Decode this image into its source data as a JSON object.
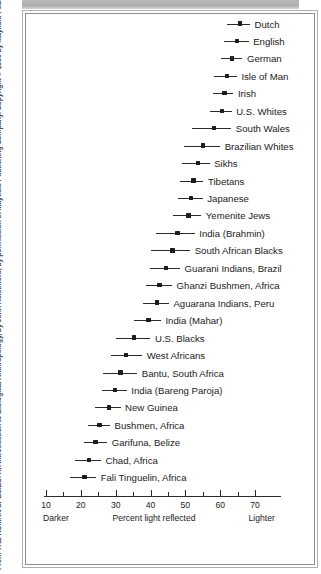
{
  "figure": {
    "credit": "From THE HUMAN SPECIES: An Introduction to Biological Anthropology, by John Relethford, by permission of Mayfield Publishing Company. Copyright © 1990 by Mayfield Publishing Company",
    "frame_color": "#8e8e8e",
    "ink_color": "#1d1d1d"
  },
  "chart_data": {
    "type": "scatter",
    "title": "",
    "xlabel": "Percent light reflected",
    "ylabel": "",
    "xlim": [
      8,
      78
    ],
    "grid": false,
    "legend": "none",
    "axis": {
      "major_ticks": [
        10,
        20,
        30,
        40,
        50,
        60,
        70
      ],
      "major_tick_labels": [
        "10",
        "20",
        "30",
        "40",
        "50",
        "60",
        "70"
      ],
      "minor_ticks": [
        15,
        25,
        35,
        45,
        55,
        65
      ],
      "left_end_label": "Darker",
      "right_end_label": "Lighter",
      "axis_title": "Percent light reflected"
    },
    "series_note": "mean percent light reflected with range bars",
    "categories": [
      "Dutch",
      "English",
      "German",
      "Isle of Man",
      "Irish",
      "U.S. Whites",
      "South Wales",
      "Brazilian Whites",
      "Sikhs",
      "Tibetans",
      "Japanese",
      "Yemenite Jews",
      "India (Brahmin)",
      "South African Blacks",
      "Guarani Indians, Brazil",
      "Ghanzi Bushmen, Africa",
      "Aguarana Indians, Peru",
      "India (Mahar)",
      "U.S. Blacks",
      "West Africans",
      "Bantu, South Africa",
      "India (Bareng Paroja)",
      "New Guinea",
      "Bushmen, Africa",
      "Garifuna, Belize",
      "Chad, Africa",
      "Fali Tinguelin, Africa"
    ],
    "points": [
      {
        "label": "Dutch",
        "value": 65.7,
        "low": 62.0,
        "high": 68.6
      },
      {
        "label": "English",
        "value": 64.8,
        "low": 61.0,
        "high": 68.2
      },
      {
        "label": "German",
        "value": 63.4,
        "low": 60.3,
        "high": 66.4
      },
      {
        "label": "Isle of Man",
        "value": 62.0,
        "low": 58.2,
        "high": 64.8
      },
      {
        "label": "Irish",
        "value": 61.3,
        "low": 58.0,
        "high": 63.8
      },
      {
        "label": "U.S. Whites",
        "value": 60.6,
        "low": 57.2,
        "high": 63.3
      },
      {
        "label": "South Wales",
        "value": 58.2,
        "low": 51.8,
        "high": 63.2
      },
      {
        "label": "Brazilian Whites",
        "value": 55.0,
        "low": 49.7,
        "high": 60.0
      },
      {
        "label": "Sikhs",
        "value": 53.6,
        "low": 49.0,
        "high": 57.0
      },
      {
        "label": "Tibetans",
        "value": 52.4,
        "low": 48.6,
        "high": 55.2
      },
      {
        "label": "Japanese",
        "value": 51.6,
        "low": 47.8,
        "high": 55.0
      },
      {
        "label": "Yemenite Jews",
        "value": 50.9,
        "low": 46.4,
        "high": 54.6
      },
      {
        "label": "India (Brahmin)",
        "value": 47.8,
        "low": 41.6,
        "high": 52.7
      },
      {
        "label": "South African Blacks",
        "value": 46.3,
        "low": 40.0,
        "high": 51.4
      },
      {
        "label": "Guarani Indians, Brazil",
        "value": 44.4,
        "low": 39.8,
        "high": 48.5
      },
      {
        "label": "Ghanzi Bushmen, Africa",
        "value": 42.6,
        "low": 38.6,
        "high": 46.2
      },
      {
        "label": "Aguarana Indians, Peru",
        "value": 41.8,
        "low": 37.8,
        "high": 45.3
      },
      {
        "label": "India (Mahar)",
        "value": 39.4,
        "low": 35.4,
        "high": 43.0
      },
      {
        "label": "U.S. Blacks",
        "value": 35.2,
        "low": 30.2,
        "high": 40.0
      },
      {
        "label": "West Africans",
        "value": 33.0,
        "low": 28.6,
        "high": 37.6
      },
      {
        "label": "Bantu, South Africa",
        "value": 31.4,
        "low": 26.4,
        "high": 36.2
      },
      {
        "label": "India (Bareng Paroja)",
        "value": 29.8,
        "low": 26.0,
        "high": 33.2
      },
      {
        "label": "New Guinea",
        "value": 28.0,
        "low": 24.0,
        "high": 31.4
      },
      {
        "label": "Bushmen, Africa",
        "value": 25.4,
        "low": 22.0,
        "high": 28.4
      },
      {
        "label": "Garifuna, Belize",
        "value": 24.2,
        "low": 20.8,
        "high": 27.6
      },
      {
        "label": "Chad, Africa",
        "value": 22.4,
        "low": 18.4,
        "high": 25.8
      },
      {
        "label": "Fali Tinguelin, Africa",
        "value": 21.0,
        "low": 16.8,
        "high": 24.4
      }
    ]
  }
}
